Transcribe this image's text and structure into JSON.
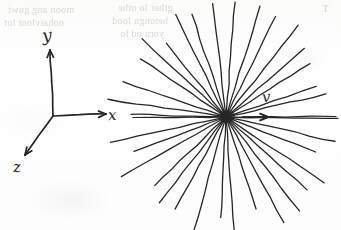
{
  "page": {
    "kind": "handwritten-physics-diagram",
    "width": 341,
    "height": 230,
    "background_color": "#fdfdfc",
    "ink_color": "#262626",
    "ghost_ink_color": "#b9b9b5"
  },
  "axes": {
    "name": "3d-coordinate-axes",
    "origin": {
      "x": 53,
      "y": 116
    },
    "rays": [
      {
        "id": "y-axis",
        "label": "y",
        "tip": {
          "x": 50,
          "y": 50
        },
        "arrowhead": true
      },
      {
        "id": "x-axis",
        "label": "x",
        "tip": {
          "x": 106,
          "y": 114
        },
        "arrowhead": true
      },
      {
        "id": "z-axis",
        "label": "z",
        "tip": {
          "x": 25,
          "y": 155
        },
        "arrowhead": true
      }
    ],
    "labels": {
      "y": "y",
      "x": "x",
      "z": "z"
    }
  },
  "burst": {
    "name": "radial-emission-burst",
    "center": {
      "x": 226,
      "y": 117
    },
    "center_blob_radius": 6,
    "ray_count": 34,
    "inner_radius": 5,
    "mean_outer_radius": 108,
    "radius_jitter": 14,
    "angle_jitter_deg": 2.5,
    "stroke_width": 1.3
  },
  "velocity": {
    "name": "velocity-vector",
    "label": "v",
    "arrow_start": {
      "x": 243,
      "y": 117
    },
    "arrow_end": {
      "x": 268,
      "y": 117
    },
    "label_position": {
      "x": 262,
      "y": 88
    }
  },
  "ghost_text": {
    "note": "faint illegible bleed-through from reverse side of the page",
    "lines": [
      {
        "text": "moon ang guwt",
        "x": 8,
        "y": 4,
        "size": 10
      },
      {
        "text": "nohaivlont lot",
        "x": 4,
        "y": 17,
        "size": 10
      },
      {
        "text": "gther lo othe",
        "x": 118,
        "y": 2,
        "size": 10
      },
      {
        "text": "hetongn lood",
        "x": 112,
        "y": 15,
        "size": 10
      },
      {
        "text": "yoru od lo",
        "x": 120,
        "y": 28,
        "size": 10
      },
      {
        "text": "T",
        "x": 322,
        "y": 3,
        "size": 10
      }
    ]
  }
}
